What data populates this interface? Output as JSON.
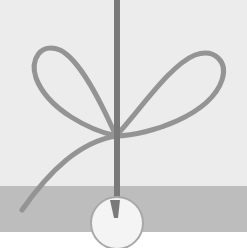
{
  "illustration": {
    "subject": "string-tied-bow-with-bead",
    "colors": {
      "background_top": "#ececec",
      "band": "#bdbdbd",
      "bottom": "#ffffff",
      "string": "#8f8f8f",
      "cord": "#7a7a7a",
      "bead_fill": "#f4f4f4",
      "bead_stroke": "#a8a8a8"
    }
  }
}
